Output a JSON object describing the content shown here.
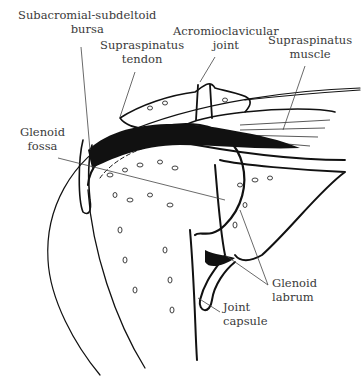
{
  "figure": {
    "labels": {
      "bursa": [
        "Subacromial-subdeltoid",
        "bursa"
      ],
      "supraspinatus_tendon": [
        "Supraspinatus",
        "tendon"
      ],
      "ac_joint": [
        "Acromioclavicular",
        "joint"
      ],
      "supraspinatus_muscle": [
        "Supraspinatus",
        "muscle"
      ],
      "glenoid_fossa": [
        "Glenoid",
        "fossa"
      ],
      "glenoid_labrum": [
        "Glenoid",
        "labrum"
      ],
      "joint_capsule": [
        "Joint",
        "capsule"
      ]
    }
  },
  "colors": {
    "ink": "#111111",
    "label": "#3a3a3a",
    "leader": "#444444",
    "background": "#ffffff"
  }
}
